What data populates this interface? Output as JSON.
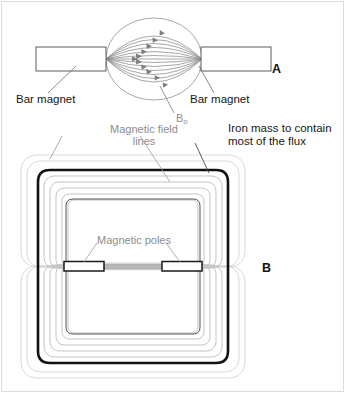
{
  "figure": {
    "background_color": "#ffffff",
    "border_color": "#d8d8d8",
    "width": 345,
    "height": 393
  },
  "colors": {
    "label_dark": "#171717",
    "label_gray": "#8d8d8d",
    "field_line": "#8a8a8a",
    "flux_line": "#b9b9b9",
    "iron_core": "#111111",
    "outline": "#4a4a4a",
    "leader_line": "#6e6e6e",
    "sphere_outline": "#8a8a8a"
  },
  "panel_a": {
    "id": "A",
    "label": "A",
    "description": "Two bar magnets facing each other with magnetic field lines bulging through the gap",
    "labels": {
      "bar_magnet_left": "Bar magnet",
      "bar_magnet_right": "Bar magnet",
      "field_symbol": "B",
      "field_symbol_subscript": "o"
    },
    "field_lines": {
      "count": 13,
      "arrow_count": 11,
      "arrow_direction": "right",
      "shape": "elliptical arcs bulging outward between poles"
    },
    "magnets": [
      {
        "name": "left-bar-magnet",
        "x": 36,
        "y": 47,
        "width": 70,
        "height": 24
      },
      {
        "name": "right-bar-magnet",
        "x": 201,
        "y": 47,
        "width": 70,
        "height": 24
      }
    ],
    "sphere": {
      "cx": 154,
      "cy": 59,
      "rx": 48,
      "ry": 41
    }
  },
  "panel_b": {
    "id": "B",
    "label": "B",
    "description": "Iron yoke electromagnet with magnetic poles and nested magnetic flux lines",
    "labels": {
      "magnetic_field_lines": "Magnetic field\nlines",
      "magnetic_field_lines_line1": "Magnetic field",
      "magnetic_field_lines_line2": "lines",
      "iron_mass": "Iron mass to contain\nmost of the flux",
      "iron_mass_line1": "Iron mass to contain",
      "iron_mass_line2": "most of the flux",
      "magnetic_poles": "Magnetic poles"
    },
    "flux_lines": {
      "inner_count": 5,
      "outer_count": 2,
      "gap_line_count": 5
    },
    "poles": [
      {
        "name": "left-pole-piece",
        "x": 64,
        "y": 262,
        "width": 40,
        "height": 9
      },
      {
        "name": "right-pole-piece",
        "x": 162,
        "y": 262,
        "width": 40,
        "height": 9
      }
    ],
    "core": {
      "name": "iron-yoke",
      "stroke_width": 2.6,
      "upper_loop": {
        "x": 38,
        "y": 170,
        "width": 190,
        "height": 100
      },
      "lower_loop": {
        "x": 38,
        "y": 263,
        "width": 190,
        "height": 100
      }
    }
  }
}
